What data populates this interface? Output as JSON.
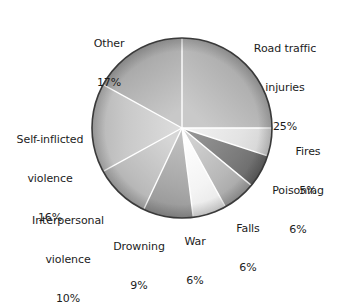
{
  "chart_data": {
    "type": "pie",
    "title": "",
    "subtitle": "",
    "xlabel": "",
    "ylabel": "",
    "legend_position": "none",
    "grid": false,
    "start_angle_deg": 0,
    "direction": "clockwise",
    "units": "percent",
    "categories": [
      "Road traffic injuries",
      "Fires",
      "Poisoning",
      "Falls",
      "War",
      "Drowning",
      "Interpersonal violence",
      "Self-inflicted violence",
      "Other"
    ],
    "values": [
      25,
      5,
      6,
      6,
      6,
      9,
      10,
      16,
      17
    ],
    "slices": [
      {
        "label": "Road traffic injuries",
        "label_lines": [
          "Road traffic",
          "injuries"
        ],
        "value": 25,
        "percent_text": "25%",
        "color": "#b0b0b0",
        "color_light": "#c9c9c9",
        "color_dark": "#9b9b9b",
        "start_deg": 0,
        "end_deg": 90
      },
      {
        "label": "Fires",
        "label_lines": [
          "Fires"
        ],
        "value": 5,
        "percent_text": "5%",
        "color": "#e3e3e3",
        "color_light": "#f2f2f2",
        "color_dark": "#d2d2d2",
        "start_deg": 90,
        "end_deg": 108
      },
      {
        "label": "Poisoning",
        "label_lines": [
          "Poisoning"
        ],
        "value": 6,
        "percent_text": "6%",
        "color": "#7b7b7b",
        "color_light": "#949494",
        "color_dark": "#666666",
        "start_deg": 108,
        "end_deg": 129.6
      },
      {
        "label": "Falls",
        "label_lines": [
          "Falls"
        ],
        "value": 6,
        "percent_text": "6%",
        "color": "#b8b8b8",
        "color_light": "#d0d0d0",
        "color_dark": "#a2a2a2",
        "start_deg": 129.6,
        "end_deg": 151.2
      },
      {
        "label": "War",
        "label_lines": [
          "War"
        ],
        "value": 6,
        "percent_text": "6%",
        "color": "#f4f4f4",
        "color_light": "#ffffff",
        "color_dark": "#e6e6e6",
        "start_deg": 151.2,
        "end_deg": 172.8
      },
      {
        "label": "Drowning",
        "label_lines": [
          "Drowning"
        ],
        "value": 9,
        "percent_text": "9%",
        "color": "#a8a8a8",
        "color_light": "#c2c2c2",
        "color_dark": "#939393",
        "start_deg": 172.8,
        "end_deg": 205.2
      },
      {
        "label": "Interpersonal violence",
        "label_lines": [
          "Interpersonal",
          "violence"
        ],
        "value": 10,
        "percent_text": "10%",
        "color": "#bdbdbd",
        "color_light": "#d6d6d6",
        "color_dark": "#a9a9a9",
        "start_deg": 205.2,
        "end_deg": 241.2
      },
      {
        "label": "Self-inflicted violence",
        "label_lines": [
          "Self-inflicted",
          "violence"
        ],
        "value": 16,
        "percent_text": "16%",
        "color": "#c9c9c9",
        "color_light": "#dedede",
        "color_dark": "#b4b4b4",
        "start_deg": 241.2,
        "end_deg": 298.8
      },
      {
        "label": "Other",
        "label_lines": [
          "Other"
        ],
        "value": 17,
        "percent_text": "17%",
        "color": "#aeaeae",
        "color_light": "#c8c8c8",
        "color_dark": "#9a9a9a",
        "start_deg": 298.8,
        "end_deg": 360
      }
    ],
    "geometry": {
      "center_x": 182,
      "center_y": 128,
      "radius": 90
    },
    "style": {
      "background": "#ffffff",
      "separator_color": "#ffffff",
      "outline_color": "#3a3a3a",
      "text_color": "#1c1c1c"
    }
  },
  "labels": {
    "road": {
      "line1": "Road traffic",
      "line2": "injuries",
      "pct": "25%"
    },
    "fires": {
      "line1": "Fires",
      "pct": "5%"
    },
    "poisoning": {
      "line1": "Poisoning",
      "pct": "6%"
    },
    "falls": {
      "line1": "Falls",
      "pct": "6%"
    },
    "war": {
      "line1": "War",
      "pct": "6%"
    },
    "drowning": {
      "line1": "Drowning",
      "pct": "9%"
    },
    "interpersonal": {
      "line1": "Interpersonal",
      "line2": "violence",
      "pct": "10%"
    },
    "selfinflicted": {
      "line1": "Self-inflicted",
      "line2": "violence",
      "pct": "16%"
    },
    "other": {
      "line1": "Other",
      "pct": "17%"
    }
  }
}
